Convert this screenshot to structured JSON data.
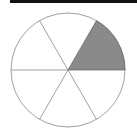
{
  "diagram": {
    "type": "fraction-circle",
    "total_sectors": 6,
    "shaded_sectors": 1,
    "shaded_fraction": "1/6",
    "colors": {
      "shaded": "#8a8a8a",
      "outline": "#888888",
      "top_bar": "#111111",
      "background": "#ffffff"
    }
  }
}
